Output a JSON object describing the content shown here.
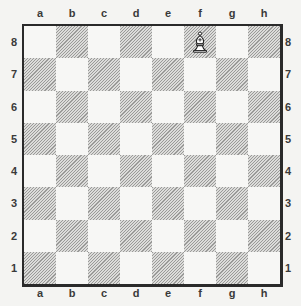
{
  "board": {
    "files": [
      "a",
      "b",
      "c",
      "d",
      "e",
      "f",
      "g",
      "h"
    ],
    "ranks": [
      "8",
      "7",
      "6",
      "5",
      "4",
      "3",
      "2",
      "1"
    ],
    "orientation": "white-bottom",
    "colors": {
      "light_square": "#f7f7f5",
      "dark_square_hatch": "#9a9a98",
      "frame": "#2a2a2a"
    }
  },
  "pieces": [
    {
      "square": "f8",
      "piece": "bishop",
      "color": "white",
      "icon": "white-bishop-icon",
      "glyph": "♗"
    }
  ]
}
